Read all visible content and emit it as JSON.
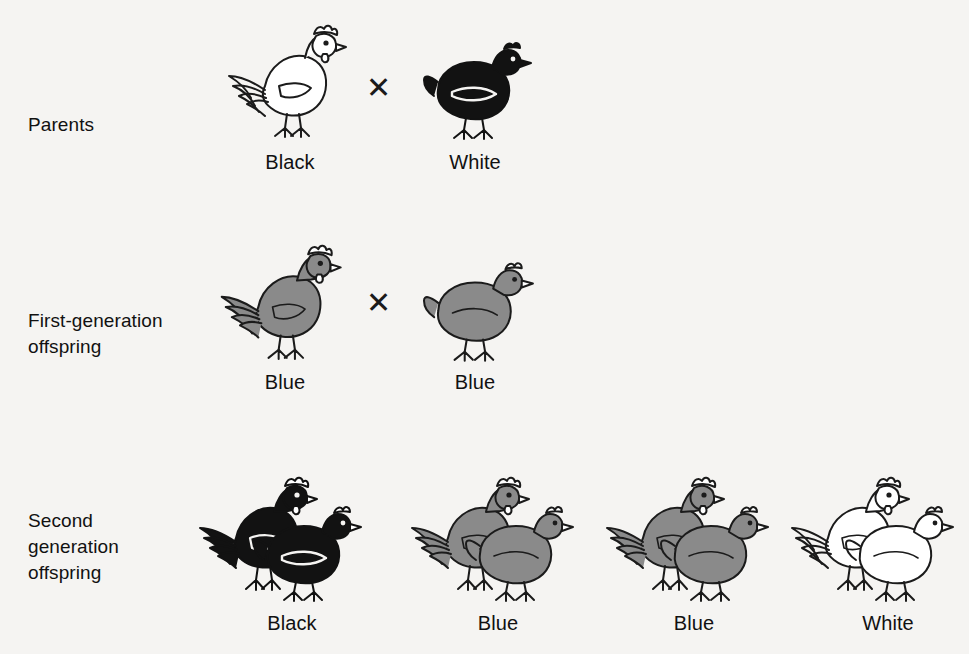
{
  "figure": {
    "background_color": "#f5f4f2",
    "ink_color": "#111111",
    "fills": {
      "black": "#121212",
      "blue": "#8a8a8a",
      "white": "#ffffff"
    }
  },
  "rows": [
    {
      "id": "parents",
      "label": "Parents",
      "cross_symbol": "✕",
      "organisms": [
        {
          "sex": "rooster",
          "fill": "black",
          "phenotype": "Black"
        },
        {
          "sex": "hen",
          "fill": "black",
          "phenotype": "White"
        }
      ]
    },
    {
      "id": "first-generation",
      "label": "First-generation\noffspring",
      "cross_symbol": "✕",
      "organisms": [
        {
          "sex": "rooster",
          "fill": "blue",
          "phenotype": "Blue"
        },
        {
          "sex": "hen",
          "fill": "blue",
          "phenotype": "Blue"
        }
      ]
    },
    {
      "id": "second-generation",
      "label": "Second\ngeneration\noffspring",
      "cross_symbol": "",
      "organisms": [
        {
          "sex": "pair",
          "fill": "black",
          "phenotype": "Black"
        },
        {
          "sex": "pair",
          "fill": "blue",
          "phenotype": "Blue"
        },
        {
          "sex": "pair",
          "fill": "blue",
          "phenotype": "Blue"
        },
        {
          "sex": "pair",
          "fill": "white",
          "phenotype": "White"
        }
      ]
    }
  ]
}
